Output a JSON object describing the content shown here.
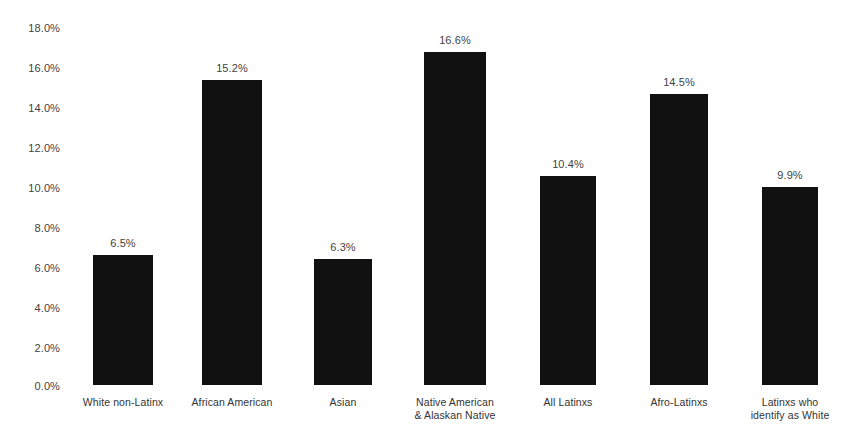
{
  "chart_data": {
    "type": "bar",
    "title": "",
    "subtitle": "",
    "xlabel": "",
    "ylabel": "",
    "ylim": [
      0,
      18
    ],
    "grid": false,
    "legend": false,
    "legend_position": "none",
    "bar_color": "#111111",
    "label_color": "#3f3f3f",
    "background": "#ffffff",
    "value_format": "percent-one-decimal",
    "y_ticks": [
      "0.0%",
      "2.0%",
      "4.0%",
      "6.0%",
      "8.0%",
      "10.0%",
      "12.0%",
      "14.0%",
      "16.0%",
      "18.0%"
    ],
    "y_tick_values": [
      0,
      2,
      4,
      6,
      8,
      10,
      12,
      14,
      16,
      18
    ],
    "categories": [
      "White non-Latinx",
      "African American",
      "Asian",
      "Native American & Alaskan Native",
      "All Latinxs",
      "Afro-Latinxs",
      "Latinxs who identify as White"
    ],
    "category_lines": [
      [
        "White non-Latinx"
      ],
      [
        "African American"
      ],
      [
        "Asian"
      ],
      [
        "Native American",
        "& Alaskan Native"
      ],
      [
        "All Latinxs"
      ],
      [
        "Afro-Latinxs"
      ],
      [
        "Latinxs who",
        "identify as White"
      ]
    ],
    "values": [
      6.5,
      15.2,
      6.3,
      16.6,
      10.4,
      14.5,
      9.9
    ],
    "data_labels": [
      "6.5%",
      "15.2%",
      "6.3%",
      "16.6%",
      "10.4%",
      "14.5%",
      "9.9%"
    ]
  }
}
